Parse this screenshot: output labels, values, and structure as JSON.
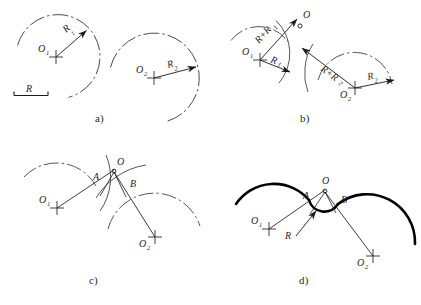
{
  "figure": {
    "background_color": "#ffffff",
    "ink_color": "#262626",
    "thick_color": "#000000"
  },
  "panels": [
    {
      "id": "a",
      "caption": "a)",
      "description": "Given: two arcs with centers O1, O2 and radii R1, R2; plus the required radius R shown as a scale bar.",
      "labels": {
        "center1": "O",
        "center1_sub": "1",
        "center2": "O",
        "center2_sub": "2",
        "radius1": "R",
        "radius1_sub": "1",
        "radius2": "R",
        "radius2_sub": "2",
        "given_radius": "R"
      }
    },
    {
      "id": "b",
      "caption": "b)",
      "description": "Auxiliary arcs of radii R+R1 from O1 and R+R2 from O2 intersect at point O.",
      "labels": {
        "center1": "O",
        "center1_sub": "1",
        "center2": "O",
        "center2_sub": "2",
        "radius1": "R",
        "radius1_sub": "1",
        "radius2": "R",
        "radius2_sub": "2",
        "sum1": "R+R",
        "sum1_sub": "1",
        "sum2": "R+R",
        "sum2_sub": "2",
        "intersection": "O"
      }
    },
    {
      "id": "c",
      "caption": "c)",
      "description": "Lines O-O1 and O-O2 locate the tangent points A and B on the given arcs.",
      "labels": {
        "center1": "O",
        "center1_sub": "1",
        "center2": "O",
        "center2_sub": "2",
        "intersection": "O",
        "tangent_a": "A",
        "tangent_b": "B"
      }
    },
    {
      "id": "d",
      "caption": "d)",
      "description": "The connecting arc of radius R is drawn from O between tangent points A and B; the outline is thickened.",
      "labels": {
        "center1": "O",
        "center1_sub": "1",
        "center2": "O",
        "center2_sub": "2",
        "intersection": "O",
        "tangent_a": "A",
        "tangent_b": "B",
        "fillet_radius": "R"
      }
    }
  ],
  "bottom_caption": ""
}
